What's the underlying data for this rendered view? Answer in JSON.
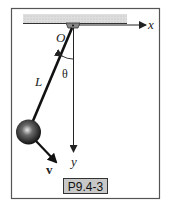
{
  "figure": {
    "labels": {
      "origin": "O",
      "x_axis": "x",
      "y_axis": "y",
      "length": "L",
      "angle": "θ",
      "velocity": "v"
    },
    "caption": "P9.4-3"
  },
  "colors": {
    "frame": "#555555",
    "ceiling_hatch": "#cfcfcf",
    "caption_box": "#c8c8c8",
    "rod": "#111111",
    "ball": "#222222"
  }
}
